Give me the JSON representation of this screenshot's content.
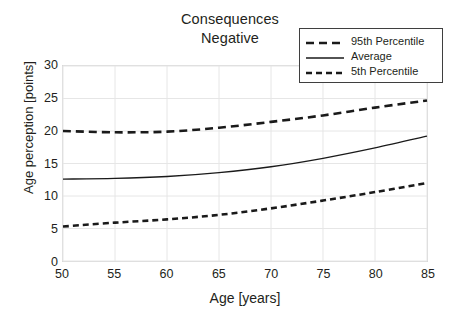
{
  "chart_data": {
    "type": "line",
    "title": "Consequences Negative",
    "title_lines": [
      "Consequences",
      "Negative"
    ],
    "xlabel": "Age [years]",
    "ylabel": "Age perception [points]",
    "xlim": [
      50,
      85
    ],
    "ylim": [
      0,
      30
    ],
    "xticks": [
      50,
      55,
      60,
      65,
      70,
      75,
      80,
      85
    ],
    "yticks": [
      0,
      5,
      10,
      15,
      20,
      25,
      30
    ],
    "grid": true,
    "legend_position": "top-right",
    "x": [
      50,
      55,
      60,
      65,
      70,
      75,
      80,
      85
    ],
    "series": [
      {
        "name": "95th Percentile",
        "style": "dashed",
        "color": "#1a1a1a",
        "width": 2.6,
        "dash": "8,5",
        "values": [
          20.0,
          19.8,
          19.9,
          20.5,
          21.4,
          22.4,
          23.6,
          24.7
        ]
      },
      {
        "name": "Average",
        "style": "solid",
        "color": "#1a1a1a",
        "width": 1.3,
        "dash": "none",
        "values": [
          12.6,
          12.7,
          13.0,
          13.6,
          14.5,
          15.8,
          17.4,
          19.2
        ]
      },
      {
        "name": "5th Percentile",
        "style": "dashed",
        "color": "#1a1a1a",
        "width": 2.6,
        "dash": "6,4",
        "values": [
          5.3,
          5.9,
          6.4,
          7.1,
          8.1,
          9.3,
          10.6,
          12.0
        ]
      }
    ]
  },
  "legend": {
    "items": [
      {
        "label": "95th Percentile",
        "key": "dashed-line-key"
      },
      {
        "label": "Average",
        "key": "solid-line-key"
      },
      {
        "label": "5th Percentile",
        "key": "dashed-line-key"
      }
    ]
  },
  "colors": {
    "line": "#1a1a1a",
    "grid": "#e6e6e6",
    "frame": "#d9d9d9",
    "legend_border": "#3f3f3f",
    "text": "#231f20",
    "background": "#ffffff"
  }
}
